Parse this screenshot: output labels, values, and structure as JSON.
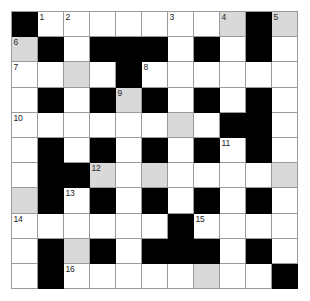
{
  "puzzle": {
    "type": "crossword",
    "title": "",
    "rows": 11,
    "cols": 11,
    "colors": {
      "empty_cell": "#ffffff",
      "block_cell": "#000000",
      "highlight_cell": "#d9d9d9",
      "grid_line": "#9a9a9a",
      "number_text": "#1a1a1a",
      "page_background": "#ffffff"
    },
    "legend": {
      "white": "open letter cell",
      "gray": "highlighted letter cell",
      "black": "blocked cell"
    },
    "clue_numbers": [
      "1",
      "2",
      "3",
      "4",
      "5",
      "6",
      "7",
      "8",
      "9",
      "10",
      "11",
      "12",
      "13",
      "14",
      "15",
      "16"
    ],
    "grid": [
      [
        {
          "state": "black",
          "number": ""
        },
        {
          "state": "white",
          "number": "1"
        },
        {
          "state": "white",
          "number": "2"
        },
        {
          "state": "white",
          "number": ""
        },
        {
          "state": "white",
          "number": ""
        },
        {
          "state": "white",
          "number": ""
        },
        {
          "state": "white",
          "number": "3"
        },
        {
          "state": "white",
          "number": ""
        },
        {
          "state": "gray",
          "number": "4"
        },
        {
          "state": "black",
          "number": ""
        },
        {
          "state": "gray",
          "number": "5"
        }
      ],
      [
        {
          "state": "gray",
          "number": "6"
        },
        {
          "state": "black",
          "number": ""
        },
        {
          "state": "white",
          "number": ""
        },
        {
          "state": "black",
          "number": ""
        },
        {
          "state": "black",
          "number": ""
        },
        {
          "state": "black",
          "number": ""
        },
        {
          "state": "white",
          "number": ""
        },
        {
          "state": "black",
          "number": ""
        },
        {
          "state": "white",
          "number": ""
        },
        {
          "state": "black",
          "number": ""
        },
        {
          "state": "white",
          "number": ""
        }
      ],
      [
        {
          "state": "white",
          "number": "7"
        },
        {
          "state": "white",
          "number": ""
        },
        {
          "state": "gray",
          "number": ""
        },
        {
          "state": "white",
          "number": ""
        },
        {
          "state": "black",
          "number": ""
        },
        {
          "state": "white",
          "number": "8"
        },
        {
          "state": "white",
          "number": ""
        },
        {
          "state": "white",
          "number": ""
        },
        {
          "state": "white",
          "number": ""
        },
        {
          "state": "white",
          "number": ""
        },
        {
          "state": "white",
          "number": ""
        }
      ],
      [
        {
          "state": "white",
          "number": ""
        },
        {
          "state": "black",
          "number": ""
        },
        {
          "state": "white",
          "number": ""
        },
        {
          "state": "black",
          "number": ""
        },
        {
          "state": "gray",
          "number": "9"
        },
        {
          "state": "black",
          "number": ""
        },
        {
          "state": "white",
          "number": ""
        },
        {
          "state": "black",
          "number": ""
        },
        {
          "state": "white",
          "number": ""
        },
        {
          "state": "black",
          "number": ""
        },
        {
          "state": "white",
          "number": ""
        }
      ],
      [
        {
          "state": "white",
          "number": "10"
        },
        {
          "state": "white",
          "number": ""
        },
        {
          "state": "white",
          "number": ""
        },
        {
          "state": "white",
          "number": ""
        },
        {
          "state": "white",
          "number": ""
        },
        {
          "state": "white",
          "number": ""
        },
        {
          "state": "gray",
          "number": ""
        },
        {
          "state": "white",
          "number": ""
        },
        {
          "state": "black",
          "number": ""
        },
        {
          "state": "black",
          "number": ""
        },
        {
          "state": "white",
          "number": ""
        }
      ],
      [
        {
          "state": "white",
          "number": ""
        },
        {
          "state": "black",
          "number": ""
        },
        {
          "state": "white",
          "number": ""
        },
        {
          "state": "black",
          "number": ""
        },
        {
          "state": "white",
          "number": ""
        },
        {
          "state": "black",
          "number": ""
        },
        {
          "state": "white",
          "number": ""
        },
        {
          "state": "black",
          "number": ""
        },
        {
          "state": "white",
          "number": "11"
        },
        {
          "state": "black",
          "number": ""
        },
        {
          "state": "white",
          "number": ""
        }
      ],
      [
        {
          "state": "white",
          "number": ""
        },
        {
          "state": "black",
          "number": ""
        },
        {
          "state": "black",
          "number": ""
        },
        {
          "state": "gray",
          "number": "12"
        },
        {
          "state": "white",
          "number": ""
        },
        {
          "state": "gray",
          "number": ""
        },
        {
          "state": "white",
          "number": ""
        },
        {
          "state": "white",
          "number": ""
        },
        {
          "state": "white",
          "number": ""
        },
        {
          "state": "white",
          "number": ""
        },
        {
          "state": "gray",
          "number": ""
        }
      ],
      [
        {
          "state": "gray",
          "number": ""
        },
        {
          "state": "black",
          "number": ""
        },
        {
          "state": "white",
          "number": "13"
        },
        {
          "state": "black",
          "number": ""
        },
        {
          "state": "white",
          "number": ""
        },
        {
          "state": "black",
          "number": ""
        },
        {
          "state": "white",
          "number": ""
        },
        {
          "state": "black",
          "number": ""
        },
        {
          "state": "white",
          "number": ""
        },
        {
          "state": "black",
          "number": ""
        },
        {
          "state": "white",
          "number": ""
        }
      ],
      [
        {
          "state": "white",
          "number": "14"
        },
        {
          "state": "white",
          "number": ""
        },
        {
          "state": "white",
          "number": ""
        },
        {
          "state": "white",
          "number": ""
        },
        {
          "state": "white",
          "number": ""
        },
        {
          "state": "white",
          "number": ""
        },
        {
          "state": "black",
          "number": ""
        },
        {
          "state": "white",
          "number": "15"
        },
        {
          "state": "white",
          "number": ""
        },
        {
          "state": "white",
          "number": ""
        },
        {
          "state": "white",
          "number": ""
        }
      ],
      [
        {
          "state": "white",
          "number": ""
        },
        {
          "state": "black",
          "number": ""
        },
        {
          "state": "gray",
          "number": ""
        },
        {
          "state": "black",
          "number": ""
        },
        {
          "state": "white",
          "number": ""
        },
        {
          "state": "black",
          "number": ""
        },
        {
          "state": "black",
          "number": ""
        },
        {
          "state": "black",
          "number": ""
        },
        {
          "state": "white",
          "number": ""
        },
        {
          "state": "black",
          "number": ""
        },
        {
          "state": "white",
          "number": ""
        }
      ],
      [
        {
          "state": "white",
          "number": ""
        },
        {
          "state": "black",
          "number": ""
        },
        {
          "state": "white",
          "number": "16"
        },
        {
          "state": "white",
          "number": ""
        },
        {
          "state": "white",
          "number": ""
        },
        {
          "state": "white",
          "number": ""
        },
        {
          "state": "white",
          "number": ""
        },
        {
          "state": "gray",
          "number": ""
        },
        {
          "state": "white",
          "number": ""
        },
        {
          "state": "white",
          "number": ""
        },
        {
          "state": "black",
          "number": ""
        }
      ]
    ]
  }
}
